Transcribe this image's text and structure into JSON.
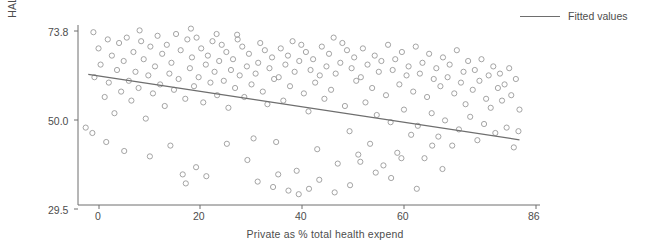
{
  "chart_data": {
    "type": "scatter",
    "title": "",
    "xlabel": "Private as % total health expend",
    "ylabel": "HALE 2000",
    "xlim": [
      0,
      90
    ],
    "ylim": [
      26.5,
      76.5
    ],
    "xticks": [
      0,
      20,
      40,
      60,
      86
    ],
    "yticks": [
      29.5,
      50.0,
      73.8
    ],
    "grid": false,
    "legend": {
      "position": "top-right",
      "entries": [
        {
          "label": "Fitted values",
          "type": "line",
          "color": "#6e6e6e"
        }
      ]
    },
    "series": [
      {
        "name": "HALE 2000 vs Private share",
        "type": "scatter",
        "marker": "open-circle",
        "color": "#9a9a9a",
        "points": [
          [
            1.5,
            48.0
          ],
          [
            2.8,
            46.5
          ],
          [
            3.2,
            62.0
          ],
          [
            4.0,
            70.0
          ],
          [
            4.4,
            65.5
          ],
          [
            5.2,
            56.5
          ],
          [
            5.8,
            72.5
          ],
          [
            6.0,
            60.5
          ],
          [
            6.6,
            68.0
          ],
          [
            7.1,
            52.0
          ],
          [
            7.6,
            64.0
          ],
          [
            8.0,
            71.5
          ],
          [
            8.4,
            58.0
          ],
          [
            8.9,
            66.5
          ],
          [
            9.5,
            73.0
          ],
          [
            9.9,
            61.0
          ],
          [
            10.4,
            55.5
          ],
          [
            10.8,
            69.0
          ],
          [
            11.2,
            63.5
          ],
          [
            11.8,
            59.0
          ],
          [
            12.3,
            72.0
          ],
          [
            12.8,
            67.0
          ],
          [
            13.2,
            50.5
          ],
          [
            13.7,
            62.5
          ],
          [
            14.1,
            70.5
          ],
          [
            14.6,
            57.5
          ],
          [
            15.0,
            65.0
          ],
          [
            15.5,
            73.5
          ],
          [
            16.0,
            60.0
          ],
          [
            16.4,
            68.5
          ],
          [
            16.9,
            54.0
          ],
          [
            17.3,
            71.0
          ],
          [
            17.8,
            63.0
          ],
          [
            18.2,
            66.0
          ],
          [
            18.7,
            58.5
          ],
          [
            19.1,
            74.0
          ],
          [
            19.6,
            61.5
          ],
          [
            20.0,
            69.5
          ],
          [
            20.4,
            35.0
          ],
          [
            20.9,
            56.0
          ],
          [
            21.3,
            72.5
          ],
          [
            21.8,
            64.5
          ],
          [
            22.2,
            67.5
          ],
          [
            22.6,
            59.5
          ],
          [
            23.1,
            73.0
          ],
          [
            23.5,
            62.0
          ],
          [
            24.0,
            70.0
          ],
          [
            24.4,
            55.0
          ],
          [
            24.9,
            65.5
          ],
          [
            25.3,
            68.0
          ],
          [
            25.8,
            60.5
          ],
          [
            26.2,
            72.0
          ],
          [
            26.6,
            63.5
          ],
          [
            27.1,
            57.0
          ],
          [
            27.5,
            66.5
          ],
          [
            28.0,
            71.0
          ],
          [
            28.4,
            61.0
          ],
          [
            28.9,
            69.0
          ],
          [
            29.3,
            53.5
          ],
          [
            29.8,
            64.0
          ],
          [
            30.2,
            67.0
          ],
          [
            30.6,
            59.0
          ],
          [
            31.1,
            72.5
          ],
          [
            31.5,
            62.5
          ],
          [
            32.0,
            70.5
          ],
          [
            32.4,
            56.5
          ],
          [
            32.9,
            65.0
          ],
          [
            33.3,
            68.5
          ],
          [
            33.8,
            60.0
          ],
          [
            34.2,
            45.0
          ],
          [
            34.6,
            63.0
          ],
          [
            35.1,
            66.0
          ],
          [
            35.5,
            71.5
          ],
          [
            36.0,
            58.0
          ],
          [
            36.4,
            69.5
          ],
          [
            36.9,
            54.5
          ],
          [
            37.3,
            64.5
          ],
          [
            37.8,
            67.5
          ],
          [
            38.2,
            61.5
          ],
          [
            38.6,
            44.0
          ],
          [
            39.1,
            62.0
          ],
          [
            39.5,
            70.0
          ],
          [
            40.0,
            55.5
          ],
          [
            40.4,
            65.5
          ],
          [
            40.9,
            68.0
          ],
          [
            41.3,
            59.5
          ],
          [
            41.8,
            72.0
          ],
          [
            42.2,
            63.5
          ],
          [
            42.6,
            36.0
          ],
          [
            43.1,
            66.5
          ],
          [
            43.5,
            71.0
          ],
          [
            44.0,
            57.5
          ],
          [
            44.4,
            69.0
          ],
          [
            44.9,
            52.5
          ],
          [
            45.3,
            64.0
          ],
          [
            45.8,
            67.0
          ],
          [
            46.2,
            60.5
          ],
          [
            46.6,
            42.0
          ],
          [
            47.1,
            62.5
          ],
          [
            47.5,
            70.5
          ],
          [
            48.0,
            56.0
          ],
          [
            48.4,
            65.0
          ],
          [
            48.9,
            68.5
          ],
          [
            49.3,
            58.5
          ],
          [
            49.8,
            73.0
          ],
          [
            50.2,
            63.0
          ],
          [
            50.6,
            38.0
          ],
          [
            51.1,
            66.0
          ],
          [
            51.5,
            71.5
          ],
          [
            52.0,
            54.0
          ],
          [
            52.4,
            69.5
          ],
          [
            52.9,
            47.0
          ],
          [
            53.3,
            64.5
          ],
          [
            53.8,
            67.5
          ],
          [
            54.2,
            61.0
          ],
          [
            54.6,
            40.5
          ],
          [
            55.1,
            62.0
          ],
          [
            55.5,
            70.0
          ],
          [
            56.0,
            55.0
          ],
          [
            56.4,
            65.5
          ],
          [
            56.9,
            43.5
          ],
          [
            57.3,
            59.0
          ],
          [
            57.8,
            68.0
          ],
          [
            58.2,
            51.5
          ],
          [
            58.6,
            63.5
          ],
          [
            59.1,
            66.5
          ],
          [
            59.5,
            37.5
          ],
          [
            60.0,
            57.0
          ],
          [
            60.4,
            71.0
          ],
          [
            60.9,
            49.5
          ],
          [
            61.3,
            64.0
          ],
          [
            61.8,
            67.0
          ],
          [
            62.2,
            41.0
          ],
          [
            62.6,
            60.0
          ],
          [
            63.1,
            69.0
          ],
          [
            63.5,
            53.0
          ],
          [
            64.0,
            62.5
          ],
          [
            64.4,
            65.0
          ],
          [
            64.9,
            46.0
          ],
          [
            65.3,
            58.0
          ],
          [
            65.8,
            70.5
          ],
          [
            66.2,
            48.5
          ],
          [
            66.6,
            63.0
          ],
          [
            67.1,
            66.0
          ],
          [
            67.5,
            39.5
          ],
          [
            68.0,
            56.5
          ],
          [
            68.4,
            68.5
          ],
          [
            68.9,
            52.0
          ],
          [
            69.3,
            61.5
          ],
          [
            69.8,
            64.5
          ],
          [
            70.2,
            45.5
          ],
          [
            70.6,
            59.5
          ],
          [
            71.1,
            67.5
          ],
          [
            71.5,
            50.0
          ],
          [
            72.0,
            62.0
          ],
          [
            72.4,
            65.5
          ],
          [
            72.9,
            43.0
          ],
          [
            73.3,
            57.5
          ],
          [
            73.8,
            69.5
          ],
          [
            74.2,
            47.5
          ],
          [
            74.6,
            60.5
          ],
          [
            75.1,
            63.5
          ],
          [
            75.5,
            54.5
          ],
          [
            76.0,
            66.5
          ],
          [
            76.4,
            51.0
          ],
          [
            76.9,
            58.5
          ],
          [
            77.3,
            64.0
          ],
          [
            77.8,
            44.5
          ],
          [
            78.2,
            61.0
          ],
          [
            78.6,
            67.0
          ],
          [
            79.1,
            49.0
          ],
          [
            79.5,
            56.0
          ],
          [
            80.0,
            62.5
          ],
          [
            80.4,
            53.5
          ],
          [
            80.9,
            65.0
          ],
          [
            81.3,
            46.5
          ],
          [
            81.8,
            59.0
          ],
          [
            82.2,
            63.0
          ],
          [
            82.6,
            55.5
          ],
          [
            83.1,
            60.0
          ],
          [
            83.5,
            48.0
          ],
          [
            84.0,
            64.5
          ],
          [
            84.4,
            57.0
          ],
          [
            84.9,
            42.5
          ],
          [
            85.3,
            61.5
          ],
          [
            85.8,
            47.0
          ],
          [
            86.0,
            53.0
          ],
          [
            3.0,
            74.5
          ],
          [
            12.0,
            75.0
          ],
          [
            22.0,
            75.5
          ],
          [
            27.0,
            74.0
          ],
          [
            31.0,
            73.8
          ],
          [
            5.5,
            44.0
          ],
          [
            9.0,
            41.5
          ],
          [
            14.0,
            40.0
          ],
          [
            18.0,
            43.0
          ],
          [
            21.0,
            32.5
          ],
          [
            23.0,
            37.0
          ],
          [
            25.0,
            34.5
          ],
          [
            35.0,
            33.0
          ],
          [
            38.0,
            31.5
          ],
          [
            41.0,
            30.5
          ],
          [
            43.0,
            29.5
          ],
          [
            45.0,
            31.0
          ],
          [
            47.0,
            33.5
          ],
          [
            50.0,
            30.0
          ],
          [
            53.0,
            32.0
          ],
          [
            58.0,
            35.5
          ],
          [
            61.0,
            34.0
          ],
          [
            66.0,
            31.0
          ],
          [
            71.0,
            36.5
          ],
          [
            29.0,
            43.5
          ],
          [
            33.0,
            39.0
          ],
          [
            39.0,
            35.0
          ],
          [
            55.0,
            38.5
          ],
          [
            63.0,
            39.5
          ],
          [
            69.0,
            43.0
          ]
        ]
      },
      {
        "name": "Fitted values",
        "type": "line",
        "color": "#6e6e6e",
        "x": [
          2.0,
          86.0
        ],
        "y": [
          62.8,
          44.6
        ]
      }
    ]
  },
  "axes": {
    "ylabel": "HALE 2000",
    "xlabel": "Private as % total health expend",
    "ytick_labels": [
      "73.8",
      "50.0",
      "29.5"
    ],
    "xtick_labels": [
      "0",
      "20",
      "40",
      "60",
      "86"
    ]
  },
  "legend": {
    "fitted_label": "Fitted values"
  }
}
